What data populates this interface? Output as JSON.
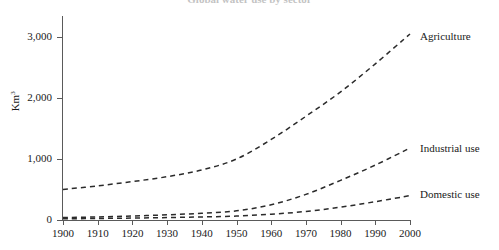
{
  "chart_data": {
    "type": "line",
    "title": "Global water use by sector",
    "xlabel": "",
    "ylabel": "Km3",
    "ylabel_display": "Km",
    "ylabel_superscript": "3",
    "xlim": [
      1900,
      2000
    ],
    "ylim": [
      0,
      3200
    ],
    "grid": false,
    "legend_position": "right-inline",
    "y_ticks": [
      0,
      1000,
      2000,
      3000
    ],
    "y_tick_labels": [
      "0",
      "1,000",
      "2,000",
      "3,000"
    ],
    "x": [
      1900,
      1910,
      1920,
      1930,
      1940,
      1950,
      1960,
      1970,
      1980,
      1990,
      2000
    ],
    "x_tick_labels": [
      "1900",
      "1910",
      "1920",
      "1930",
      "1940",
      "1950",
      "1960",
      "1970",
      "1980",
      "1990",
      "2000"
    ],
    "series": [
      {
        "name": "Agriculture",
        "style": "dashed",
        "color": "#2b2b2b",
        "values": [
          500,
          560,
          630,
          710,
          820,
          1000,
          1320,
          1700,
          2100,
          2560,
          3050
        ]
      },
      {
        "name": "Industrial use",
        "style": "dashed",
        "color": "#2b2b2b",
        "values": [
          40,
          50,
          65,
          85,
          110,
          150,
          250,
          420,
          650,
          900,
          1180
        ]
      },
      {
        "name": "Domestic use",
        "style": "dashed",
        "color": "#2b2b2b",
        "values": [
          20,
          25,
          32,
          40,
          50,
          65,
          95,
          140,
          210,
          300,
          400
        ]
      }
    ]
  },
  "axis": {
    "y_caption": "Km",
    "y_caption_sup": "3"
  }
}
